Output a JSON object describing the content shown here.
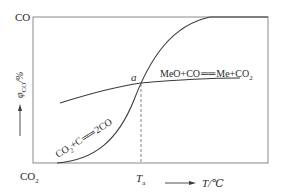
{
  "diagram": {
    "y_top_label": "CO",
    "y_bottom_label": "CO",
    "y_bottom_label_sub": "2",
    "y_axis_label_main": "φ",
    "y_axis_label_sub": "CO",
    "y_axis_label_unit": "/%",
    "x_axis_label": "T/℃",
    "x_marker_label": "T",
    "x_marker_sub": "a",
    "intersection_label": "a",
    "curve1": {
      "label_part1": "MeO+CO",
      "label_eq": "══",
      "label_part2": "Me+CO",
      "label_sub": "2",
      "description": "flat curve, slowly increasing"
    },
    "curve2": {
      "label_part1": "CO",
      "label_sub1": "2",
      "label_part2": "+C",
      "label_eq": "══",
      "label_part3": "2CO",
      "description": "S-shaped curve rising from CO2 to CO"
    },
    "colors": {
      "frame": "#8a8a8a",
      "curve": "#3a3a3a",
      "text": "#2a2a2a"
    }
  }
}
